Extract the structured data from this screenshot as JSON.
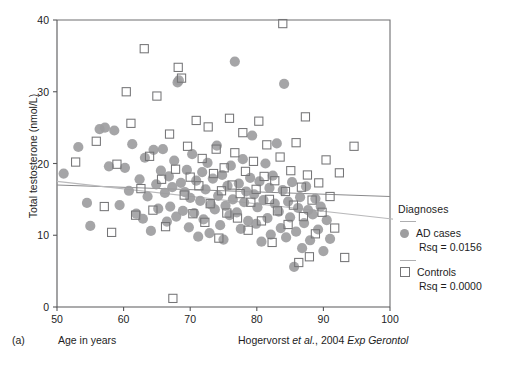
{
  "figure": {
    "panel_letter": "(a)",
    "citation_author": "Hogervorst",
    "citation_italic_1": "et al.",
    "citation_mid": ", 2004 ",
    "citation_italic_2": "Exp Gerontol"
  },
  "legend": {
    "title": "Diagnoses",
    "ad_label": "AD cases",
    "ad_rsq": "Rsq = 0.0156",
    "ctrl_label": "Controls",
    "ctrl_rsq": "Rsq = 0.0000"
  },
  "colors": {
    "ad_marker": "#9d9d9f",
    "ctrl_marker_stroke": "#757577",
    "axis": "#58585a",
    "fit_ad": "#8a8a8c",
    "fit_ctrl": "#b9b9bb"
  },
  "chart_data": {
    "type": "scatter",
    "title": "",
    "xlabel": "Age in years",
    "ylabel": "Total testosterone (nmol/L)",
    "xlim": [
      50,
      100
    ],
    "ylim": [
      0,
      40
    ],
    "xticks": [
      50,
      60,
      70,
      80,
      90,
      100
    ],
    "yticks": [
      0,
      10,
      20,
      30,
      40
    ],
    "grid": false,
    "legend_position": "right-outside",
    "series": [
      {
        "name": "AD cases",
        "marker": "filled-circle",
        "color": "#9d9d9f",
        "rsq": 0.0156,
        "fit_line": {
          "x": [
            50,
            100
          ],
          "y": [
            17.0,
            15.4
          ]
        },
        "points": [
          [
            51.0,
            18.6
          ],
          [
            53.2,
            22.3
          ],
          [
            54.5,
            14.5
          ],
          [
            55.0,
            11.3
          ],
          [
            56.4,
            24.8
          ],
          [
            57.2,
            25.0
          ],
          [
            57.8,
            19.6
          ],
          [
            58.6,
            24.6
          ],
          [
            59.4,
            14.2
          ],
          [
            60.2,
            19.4
          ],
          [
            60.8,
            16.2
          ],
          [
            61.3,
            22.7
          ],
          [
            61.9,
            13.0
          ],
          [
            62.4,
            17.8
          ],
          [
            62.9,
            12.3
          ],
          [
            63.2,
            20.8
          ],
          [
            63.6,
            15.4
          ],
          [
            64.1,
            10.6
          ],
          [
            64.5,
            21.9
          ],
          [
            64.9,
            17.1
          ],
          [
            65.2,
            13.7
          ],
          [
            65.6,
            19.0
          ],
          [
            65.9,
            22.0
          ],
          [
            66.2,
            15.9
          ],
          [
            66.5,
            11.9
          ],
          [
            66.8,
            18.2
          ],
          [
            67.0,
            14.0
          ],
          [
            67.3,
            16.7
          ],
          [
            67.6,
            20.4
          ],
          [
            67.9,
            12.6
          ],
          [
            68.1,
            31.3
          ],
          [
            68.3,
            31.6
          ],
          [
            68.6,
            17.3
          ],
          [
            68.9,
            13.4
          ],
          [
            69.2,
            16.0
          ],
          [
            69.5,
            19.1
          ],
          [
            69.8,
            11.1
          ],
          [
            70.0,
            15.2
          ],
          [
            70.3,
            21.3
          ],
          [
            70.6,
            13.1
          ],
          [
            70.9,
            17.6
          ],
          [
            71.2,
            9.8
          ],
          [
            71.5,
            14.8
          ],
          [
            71.8,
            18.8
          ],
          [
            72.0,
            12.2
          ],
          [
            72.3,
            16.4
          ],
          [
            72.6,
            20.1
          ],
          [
            72.9,
            10.3
          ],
          [
            73.1,
            14.3
          ],
          [
            73.4,
            17.9
          ],
          [
            73.7,
            13.6
          ],
          [
            74.0,
            22.5
          ],
          [
            74.2,
            15.5
          ],
          [
            74.5,
            11.4
          ],
          [
            74.8,
            18.4
          ],
          [
            75.0,
            9.4
          ],
          [
            75.3,
            14.1
          ],
          [
            75.6,
            16.9
          ],
          [
            75.9,
            12.8
          ],
          [
            76.1,
            19.7
          ],
          [
            76.4,
            15.0
          ],
          [
            76.7,
            34.2
          ],
          [
            77.0,
            13.2
          ],
          [
            77.3,
            17.2
          ],
          [
            77.6,
            10.9
          ],
          [
            77.9,
            20.6
          ],
          [
            78.1,
            14.6
          ],
          [
            78.4,
            16.1
          ],
          [
            78.7,
            12.0
          ],
          [
            79.0,
            18.0
          ],
          [
            79.3,
            23.9
          ],
          [
            79.6,
            15.7
          ],
          [
            79.9,
            11.6
          ],
          [
            80.1,
            13.9
          ],
          [
            80.4,
            17.5
          ],
          [
            80.7,
            9.1
          ],
          [
            81.0,
            14.9
          ],
          [
            81.3,
            20.0
          ],
          [
            81.6,
            12.4
          ],
          [
            81.9,
            16.6
          ],
          [
            82.1,
            10.1
          ],
          [
            82.4,
            18.3
          ],
          [
            82.7,
            14.4
          ],
          [
            83.0,
            22.8
          ],
          [
            83.3,
            13.3
          ],
          [
            83.6,
            11.0
          ],
          [
            83.9,
            16.3
          ],
          [
            84.1,
            31.1
          ],
          [
            84.4,
            9.7
          ],
          [
            84.7,
            14.7
          ],
          [
            85.0,
            12.5
          ],
          [
            85.3,
            17.4
          ],
          [
            85.6,
            5.6
          ],
          [
            85.9,
            10.5
          ],
          [
            86.2,
            13.8
          ],
          [
            86.5,
            15.3
          ],
          [
            86.8,
            8.2
          ],
          [
            87.1,
            11.7
          ],
          [
            87.4,
            16.8
          ],
          [
            87.7,
            13.5
          ],
          [
            88.0,
            9.3
          ],
          [
            88.4,
            12.9
          ],
          [
            88.8,
            15.1
          ],
          [
            89.2,
            10.8
          ],
          [
            89.6,
            14.0
          ],
          [
            90.0,
            7.8
          ],
          [
            90.5,
            12.1
          ],
          [
            91.0,
            9.5
          ]
        ]
      },
      {
        "name": "Controls",
        "marker": "open-square",
        "color": "#757577",
        "rsq": 0.0,
        "fit_line": {
          "x": [
            50,
            100
          ],
          "y": [
            17.5,
            12.3
          ]
        },
        "points": [
          [
            52.8,
            20.2
          ],
          [
            55.9,
            23.1
          ],
          [
            57.1,
            14.0
          ],
          [
            58.2,
            10.4
          ],
          [
            59.0,
            19.9
          ],
          [
            60.4,
            30.0
          ],
          [
            61.1,
            25.6
          ],
          [
            61.8,
            12.8
          ],
          [
            62.6,
            16.5
          ],
          [
            63.1,
            36.0
          ],
          [
            63.9,
            21.0
          ],
          [
            64.4,
            13.5
          ],
          [
            65.0,
            29.4
          ],
          [
            65.7,
            17.8
          ],
          [
            66.3,
            11.2
          ],
          [
            66.9,
            24.1
          ],
          [
            67.4,
            1.2
          ],
          [
            67.8,
            19.2
          ],
          [
            68.2,
            33.4
          ],
          [
            68.7,
            31.9
          ],
          [
            69.1,
            15.6
          ],
          [
            69.6,
            22.4
          ],
          [
            70.0,
            18.1
          ],
          [
            70.4,
            13.0
          ],
          [
            70.9,
            26.0
          ],
          [
            71.3,
            16.9
          ],
          [
            71.8,
            20.7
          ],
          [
            72.2,
            11.8
          ],
          [
            72.7,
            25.1
          ],
          [
            73.0,
            14.4
          ],
          [
            73.5,
            18.6
          ],
          [
            73.9,
            22.0
          ],
          [
            74.3,
            9.6
          ],
          [
            74.7,
            16.2
          ],
          [
            75.1,
            19.4
          ],
          [
            75.5,
            13.1
          ],
          [
            75.9,
            26.3
          ],
          [
            76.3,
            17.0
          ],
          [
            76.7,
            21.5
          ],
          [
            77.1,
            12.4
          ],
          [
            77.5,
            15.8
          ],
          [
            77.9,
            24.3
          ],
          [
            78.3,
            18.9
          ],
          [
            78.7,
            10.7
          ],
          [
            79.1,
            14.6
          ],
          [
            79.5,
            20.3
          ],
          [
            79.9,
            16.4
          ],
          [
            80.3,
            25.9
          ],
          [
            80.7,
            12.0
          ],
          [
            81.1,
            18.2
          ],
          [
            81.5,
            22.6
          ],
          [
            81.9,
            15.0
          ],
          [
            82.3,
            9.0
          ],
          [
            82.7,
            17.6
          ],
          [
            83.1,
            13.4
          ],
          [
            83.5,
            20.9
          ],
          [
            83.9,
            39.5
          ],
          [
            84.3,
            16.1
          ],
          [
            84.7,
            11.5
          ],
          [
            85.1,
            19.0
          ],
          [
            85.5,
            14.2
          ],
          [
            85.9,
            22.9
          ],
          [
            86.3,
            6.2
          ],
          [
            86.7,
            16.7
          ],
          [
            87.0,
            12.6
          ],
          [
            87.3,
            26.5
          ],
          [
            87.6,
            18.4
          ],
          [
            87.9,
            7.0
          ],
          [
            88.3,
            14.9
          ],
          [
            88.8,
            10.2
          ],
          [
            89.3,
            17.3
          ],
          [
            89.8,
            13.2
          ],
          [
            90.4,
            20.5
          ],
          [
            91.0,
            15.4
          ],
          [
            91.7,
            11.0
          ],
          [
            92.4,
            18.7
          ],
          [
            93.2,
            6.9
          ],
          [
            94.6,
            22.4
          ]
        ]
      }
    ]
  }
}
